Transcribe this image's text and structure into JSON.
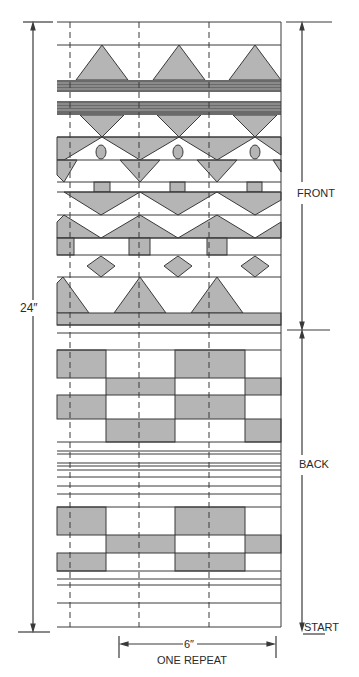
{
  "colors": {
    "fill": "#b5b5b5",
    "line": "#3a3a3a",
    "paper": "#ffffff",
    "stripe": "#555555"
  },
  "labels": {
    "height": "24″",
    "front": "FRONT",
    "back": "BACK",
    "start": "START",
    "repeat_width": "6″",
    "repeat_caption": "ONE REPEAT"
  },
  "sections": [
    {
      "name": "front",
      "motifs": [
        "triangles-up",
        "double stripe bands",
        "inverted triangles",
        "hourglass with ovals",
        "inverted triangles",
        "small squares",
        "inverted triangles",
        "triangles-up",
        "rectangle blocks",
        "diamonds",
        "triangles-up",
        "solid band"
      ]
    },
    {
      "name": "back",
      "motifs": [
        "checkerboard blocks",
        "pinstripes",
        "checkerboard blocks",
        "pinstripes"
      ]
    }
  ],
  "repeat_count": 3
}
